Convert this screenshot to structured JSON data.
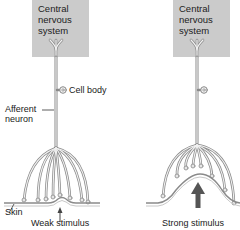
{
  "panels": [
    {
      "id": "weak",
      "cns_label": [
        "Central",
        "nervous",
        "system"
      ],
      "stimulus_label": "Weak stimulus"
    },
    {
      "id": "strong",
      "cns_label": [
        "Central",
        "nervous",
        "system"
      ],
      "stimulus_label": "Strong stimulus"
    }
  ],
  "labels": {
    "cell_body": "Cell body",
    "afferent_line1": "Afferent",
    "afferent_line2": "neuron",
    "skin": "Skin"
  },
  "colors": {
    "cns_box": "#cbcbcb",
    "neuron_outline": "#8a8a8a",
    "neuron_fill": "#f2f2f2",
    "skin": "#8a8a8a",
    "arrow": "#555555"
  }
}
